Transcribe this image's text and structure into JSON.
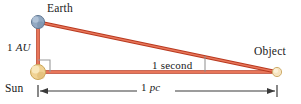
{
  "diagram": {
    "labels": {
      "earth": "Earth",
      "sun": "Sun",
      "object": "Object",
      "baseline_value": "1",
      "baseline_unit": "AU",
      "angle": "1 second",
      "distance_value": "1",
      "distance_unit": "pc"
    },
    "colors": {
      "line_fill": "#e8765a",
      "line_stroke": "#b8391f",
      "earth_fill": "#8fa8c4",
      "earth_stroke": "#5a7390",
      "sun_fill": "#f2d89a",
      "sun_stroke": "#c9a455",
      "object_fill": "#f7e6c4",
      "object_stroke": "#c9a455",
      "dimension_line": "#3a3a3a",
      "right_angle": "#9a9a9a",
      "text": "#1a1a1a"
    },
    "geometry": {
      "earth_point": [
        38,
        22
      ],
      "sun_point": [
        38,
        72
      ],
      "object_point": [
        277,
        72
      ],
      "earth_radius": 6.5,
      "sun_radius": 7.5,
      "object_radius": 4.5,
      "dimension_y": 91
    }
  }
}
